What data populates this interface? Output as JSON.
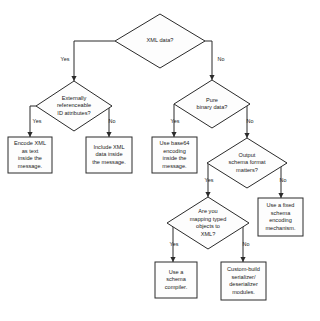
{
  "diagram": {
    "type": "flowchart",
    "style": {
      "background_color": "#ffffff",
      "shape_fill": "#fdfdfd",
      "stroke_color": "#2b2b2b",
      "text_color": "#1a1a1a"
    },
    "nodes": [
      {
        "id": "n1",
        "shape": "diamond",
        "lines": [
          "XML data?"
        ],
        "cx": 160,
        "cy": 41,
        "rx": 45,
        "ry": 27
      },
      {
        "id": "n2",
        "shape": "diamond",
        "lines": [
          "Externally",
          "referenceable",
          "ID attributes?"
        ],
        "cx": 74,
        "cy": 106,
        "rx": 38,
        "ry": 25
      },
      {
        "id": "n3",
        "shape": "diamond",
        "lines": [
          "Pure",
          "binary data?"
        ],
        "cx": 212,
        "cy": 104,
        "rx": 38,
        "ry": 24
      },
      {
        "id": "n4",
        "shape": "rect",
        "lines": [
          "Encode XML",
          "as text",
          "inside the",
          "message."
        ],
        "x": 8,
        "y": 137,
        "w": 44,
        "h": 36
      },
      {
        "id": "n5",
        "shape": "rect",
        "lines": [
          "Include XML",
          "data inside",
          "the message."
        ],
        "x": 86,
        "y": 137,
        "w": 46,
        "h": 36
      },
      {
        "id": "n6",
        "shape": "rect",
        "lines": [
          "Use base64",
          "encoding",
          "inside the",
          "message."
        ],
        "x": 152,
        "y": 137,
        "w": 45,
        "h": 36
      },
      {
        "id": "n7",
        "shape": "diamond",
        "lines": [
          "Output",
          "schema format",
          "matters?"
        ],
        "cx": 247,
        "cy": 163,
        "rx": 40,
        "ry": 25
      },
      {
        "id": "n8",
        "shape": "rect",
        "lines": [
          "Use a fixed",
          "schema",
          "encoding",
          "mechanism."
        ],
        "x": 258,
        "y": 198,
        "w": 45,
        "h": 38
      },
      {
        "id": "n9",
        "shape": "diamond",
        "lines": [
          "Are you",
          "mapping typed",
          "objects to",
          "XML?"
        ],
        "cx": 208,
        "cy": 223,
        "rx": 41,
        "ry": 26
      },
      {
        "id": "n10",
        "shape": "rect",
        "lines": [
          "Use a",
          "schema",
          "compiler."
        ],
        "x": 155,
        "y": 262,
        "w": 42,
        "h": 36
      },
      {
        "id": "n11",
        "shape": "rect",
        "lines": [
          "Custom-build",
          "serializer/",
          "deserializer",
          "modules."
        ],
        "x": 221,
        "y": 262,
        "w": 45,
        "h": 38
      }
    ],
    "edges": [
      {
        "id": "e1",
        "from": "n1",
        "to": "n2",
        "label": "Yes",
        "label_x": 65,
        "label_y": 60,
        "path": "M 115 41 L 74 41 L 74 81",
        "arrow_x": 74,
        "arrow_y": 81
      },
      {
        "id": "e2",
        "from": "n1",
        "to": "n3",
        "label": "No",
        "label_x": 221,
        "label_y": 60,
        "path": "M 205 41 L 212 41 L 212 80",
        "arrow_x": 212,
        "arrow_y": 80
      },
      {
        "id": "e3",
        "from": "n2",
        "to": "n4",
        "label": "Yes",
        "label_x": 37,
        "label_y": 122,
        "path": "M 36 106 L 30 106 L 30 137",
        "arrow_x": 30,
        "arrow_y": 137
      },
      {
        "id": "e4",
        "from": "n2",
        "to": "n5",
        "label": "No",
        "label_x": 112,
        "label_y": 122,
        "path": "M 112 106 L 109 106 L 109 137",
        "arrow_x": 109,
        "arrow_y": 137
      },
      {
        "id": "e5",
        "from": "n3",
        "to": "n6",
        "label": "Yes",
        "label_x": 175,
        "label_y": 122,
        "path": "M 174 104 L 174 137",
        "arrow_x": 174,
        "arrow_y": 137
      },
      {
        "id": "e6",
        "from": "n3",
        "to": "n7",
        "label": "No",
        "label_x": 250,
        "label_y": 122,
        "path": "M 250 104 L 247 104 L 247 138",
        "arrow_x": 247,
        "arrow_y": 138
      },
      {
        "id": "e7",
        "from": "n7",
        "to": "n9",
        "label": "Yes",
        "label_x": 209,
        "label_y": 181,
        "path": "M 208 163 L 208 197",
        "arrow_x": 208,
        "arrow_y": 197
      },
      {
        "id": "e8",
        "from": "n7",
        "to": "n8",
        "label": "No",
        "label_x": 283,
        "label_y": 181,
        "path": "M 287 163 L 281 163 L 281 198",
        "arrow_x": 281,
        "arrow_y": 198
      },
      {
        "id": "e9",
        "from": "n9",
        "to": "n10",
        "label": "Yes",
        "label_x": 174,
        "label_y": 245,
        "path": "M 173 223 L 173 262",
        "arrow_x": 173,
        "arrow_y": 262
      },
      {
        "id": "e10",
        "from": "n9",
        "to": "n11",
        "label": "No",
        "label_x": 246,
        "label_y": 245,
        "path": "M 243 223 L 243 262",
        "arrow_x": 243,
        "arrow_y": 262
      }
    ]
  }
}
